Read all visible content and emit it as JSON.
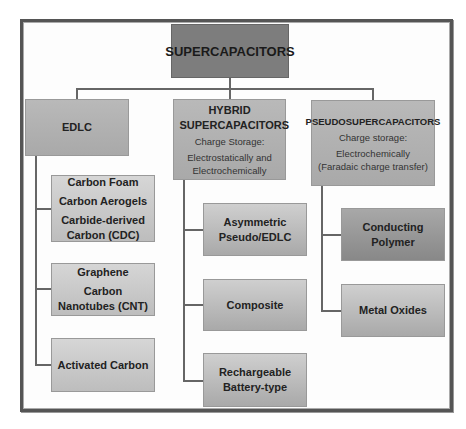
{
  "diagram": {
    "root": {
      "label": "SUPERCAPACITORS"
    },
    "categories": [
      {
        "title": "EDLC",
        "subtitle": "",
        "detail": "",
        "children": [
          {
            "lines": [
              "Carbon Foam",
              "Carbon Aerogels",
              "Carbide-derived Carbon (CDC)"
            ]
          },
          {
            "lines": [
              "Graphene",
              "Carbon Nanotubes (CNT)"
            ]
          },
          {
            "lines": [
              "Activated Carbon"
            ]
          }
        ]
      },
      {
        "title": "HYBRID SUPERCAPACITORS",
        "subtitle": "Charge Storage:",
        "detail": "Electrostatically and Electrochemically",
        "children": [
          {
            "lines": [
              "Asymmetric Pseudo/EDLC"
            ]
          },
          {
            "lines": [
              "Composite"
            ]
          },
          {
            "lines": [
              "Rechargeable Battery-type"
            ]
          }
        ]
      },
      {
        "title": "PSEUDOSUPERCAPACITORS",
        "subtitle": "Charge storage:",
        "detail": "Electrochemically (Faradaic charge transfer)",
        "children": [
          {
            "lines": [
              "Conducting Polymer"
            ]
          },
          {
            "lines": [
              "Metal Oxides"
            ]
          }
        ]
      }
    ]
  }
}
